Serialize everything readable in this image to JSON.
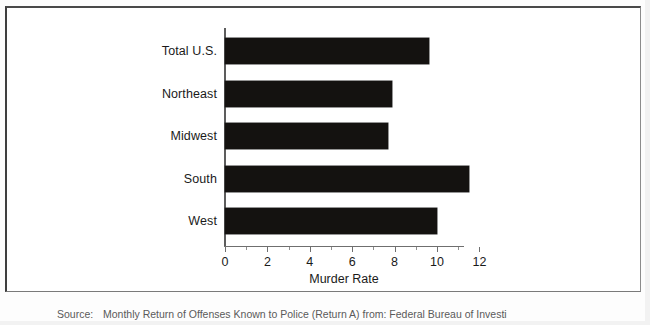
{
  "figure": {
    "axis_title": "Murder Rate"
  },
  "chart_data": {
    "type": "bar",
    "orientation": "horizontal",
    "title": "",
    "subtitle": "",
    "xlabel": "Murder Rate",
    "ylabel": "",
    "categories": [
      "Total U.S.",
      "Northeast",
      "Midwest",
      "South",
      "West"
    ],
    "values": [
      9.6,
      7.9,
      7.7,
      11.5,
      10.0
    ],
    "series": [
      {
        "name": "Murder Rate",
        "values": [
          9.6,
          7.9,
          7.7,
          11.5,
          10.0
        ],
        "color": "#141210"
      }
    ],
    "xlim": [
      0,
      12
    ],
    "tick_labels": [
      "0",
      "2",
      "4",
      "6",
      "8",
      "10",
      "12"
    ],
    "tick_values": [
      0,
      2,
      4,
      6,
      8,
      10,
      12
    ],
    "minor_tick_values": [
      1,
      3,
      5,
      7,
      9,
      11
    ],
    "grid": false,
    "legend": false,
    "legend_position": "none",
    "bar_color": "#141210",
    "axis_color": "#6f6f6f"
  },
  "source": {
    "key": "Source:",
    "text": "Monthly Return of Offenses Known to Police (Return A) from: Federal Bureau of Investi"
  }
}
